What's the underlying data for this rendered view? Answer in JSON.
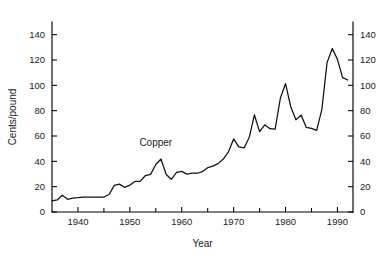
{
  "page": {
    "top_fragment": "· · ·  ·  ·   ·"
  },
  "chart_data": {
    "type": "line",
    "title": "",
    "xlabel": "Year",
    "ylabel": "Cents/pound",
    "xlim": [
      1935,
      1993
    ],
    "ylim": [
      0,
      150
    ],
    "grid": false,
    "legend": false,
    "annotations": [
      {
        "text": "Copper",
        "x": 1955,
        "y": 52
      }
    ],
    "axes": {
      "left": {
        "label": "Cents/pound",
        "ticks": [
          0,
          20,
          40,
          60,
          80,
          100,
          120,
          140
        ],
        "tick_labels": [
          "0",
          "20",
          "40",
          "60",
          "80",
          "100",
          "120",
          "140"
        ]
      },
      "right": {
        "label": "",
        "ticks": [
          0,
          20,
          40,
          60,
          80,
          100,
          120,
          140
        ],
        "tick_labels": [
          "0",
          "20",
          "40",
          "60",
          "80",
          "100",
          "120",
          "140"
        ]
      },
      "bottom": {
        "label": "Year",
        "major_ticks": [
          1940,
          1950,
          1960,
          1970,
          1980,
          1990
        ],
        "major_tick_labels": [
          "1940",
          "1950",
          "1960",
          "1970",
          "1980",
          "1990"
        ],
        "minor_ticks": [
          1945,
          1955,
          1965,
          1975,
          1985
        ]
      }
    },
    "series": [
      {
        "name": "Copper",
        "units": "cents/pound",
        "x": [
          1935,
          1936,
          1937,
          1938,
          1939,
          1940,
          1941,
          1942,
          1943,
          1944,
          1945,
          1946,
          1947,
          1948,
          1949,
          1950,
          1951,
          1952,
          1953,
          1954,
          1955,
          1956,
          1957,
          1958,
          1959,
          1960,
          1961,
          1962,
          1963,
          1964,
          1965,
          1966,
          1967,
          1968,
          1969,
          1970,
          1971,
          1972,
          1973,
          1974,
          1975,
          1976,
          1977,
          1978,
          1979,
          1980,
          1981,
          1982,
          1983,
          1984,
          1985,
          1986,
          1987,
          1988,
          1989,
          1990,
          1991,
          1992
        ],
        "values": [
          8.7,
          9.5,
          13.2,
          10.0,
          11.0,
          11.3,
          11.8,
          11.8,
          11.8,
          11.8,
          11.8,
          13.8,
          21.0,
          22.0,
          19.4,
          21.2,
          24.2,
          24.2,
          28.8,
          29.7,
          37.5,
          41.8,
          29.6,
          25.8,
          31.2,
          32.1,
          29.9,
          30.6,
          30.6,
          31.9,
          35.0,
          36.2,
          38.2,
          41.8,
          47.5,
          57.7,
          51.4,
          50.6,
          58.8,
          76.6,
          63.5,
          68.8,
          65.8,
          65.5,
          89.8,
          101.4,
          83.1,
          72.8,
          76.5,
          66.8,
          66.0,
          64.4,
          81.0,
          117.9,
          129.1,
          120.5,
          106.1,
          104.2
        ]
      }
    ]
  }
}
